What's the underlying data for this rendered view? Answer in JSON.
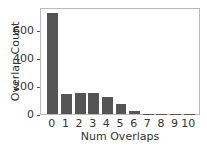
{
  "chart_data": {
    "type": "bar",
    "title": "",
    "xlabel": "Num Overlaps",
    "ylabel": "Overlap Count",
    "categories": [
      "0",
      "1",
      "2",
      "3",
      "4",
      "5",
      "6",
      "7",
      "8",
      "9",
      "10"
    ],
    "values": [
      720,
      143,
      147,
      152,
      122,
      75,
      22,
      2,
      1,
      1,
      1
    ],
    "yticks": [
      "0",
      "200",
      "400",
      "600"
    ],
    "ylim": [
      0,
      760
    ],
    "grid": false,
    "bar_color": "#555555"
  }
}
